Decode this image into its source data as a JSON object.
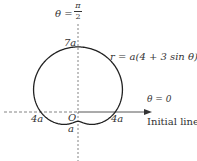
{
  "diagram": {
    "equation": "r = a(4 + 3 sin θ)",
    "vertical_axis_label": "θ = π/2",
    "vertical_axis_theta": "θ =",
    "vertical_axis_num": "π",
    "vertical_axis_den": "2",
    "initial_line_angle": "θ = 0",
    "initial_line_label": "Initial line",
    "pole_label": "O",
    "top_intercept": "7a",
    "left_intercept": "4a",
    "right_intercept": "4a",
    "bottom_intercept": "a",
    "curve_params": {
      "a": 1,
      "b": 4,
      "c": 3
    },
    "colors": {
      "curve": "#222222",
      "axes": "#555555",
      "text": "#333333"
    }
  }
}
